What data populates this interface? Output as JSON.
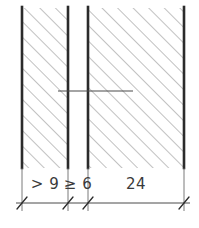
{
  "drawing": {
    "type": "technical-cross-section",
    "background_color": "#ffffff",
    "line_color": "#2b2b2b",
    "hatch_color": "#8c8c8c",
    "text_color": "#3a3a3a",
    "canvas": {
      "width": 199,
      "height": 228
    },
    "regions": [
      {
        "id": "left-wall",
        "name": "left-hatched-wall",
        "x_start": 22,
        "x_end": 68,
        "y_start": 8,
        "y_end": 168,
        "hatched": true
      },
      {
        "id": "cavity",
        "name": "unhatched-gap",
        "x_start": 68,
        "x_end": 88,
        "y_start": 8,
        "y_end": 168,
        "hatched": false
      },
      {
        "id": "right-wall",
        "name": "right-hatched-wall",
        "x_start": 88,
        "x_end": 184,
        "y_start": 8,
        "y_end": 168,
        "hatched": true
      }
    ],
    "edges": [
      {
        "name": "left-outer-edge",
        "x": 22
      },
      {
        "name": "left-inner-edge",
        "x": 68
      },
      {
        "name": "right-inner-edge",
        "x": 88
      },
      {
        "name": "right-outer-edge",
        "x": 184
      }
    ],
    "leader_line": {
      "name": "horizontal-leader",
      "x_start": 58,
      "x_end": 133,
      "y": 91
    },
    "dimension_line": {
      "name": "dimension-chain",
      "y": 203,
      "x_start": 18,
      "x_end": 188,
      "tick_style": "oblique-slash",
      "ticks": [
        22,
        68,
        88,
        184
      ]
    },
    "dimensions": [
      {
        "id": "dim-left",
        "name": "dimension-left-wall",
        "label": "> 9",
        "x_center": 45,
        "x_from": 22,
        "x_to": 68
      },
      {
        "id": "dim-gap",
        "name": "dimension-gap",
        "label": "≥ 6",
        "x_center": 78,
        "x_from": 68,
        "x_to": 88
      },
      {
        "id": "dim-right",
        "name": "dimension-right-wall",
        "label": "24",
        "x_center": 136,
        "x_from": 88,
        "x_to": 184
      }
    ],
    "label_baseline_y": 189
  }
}
